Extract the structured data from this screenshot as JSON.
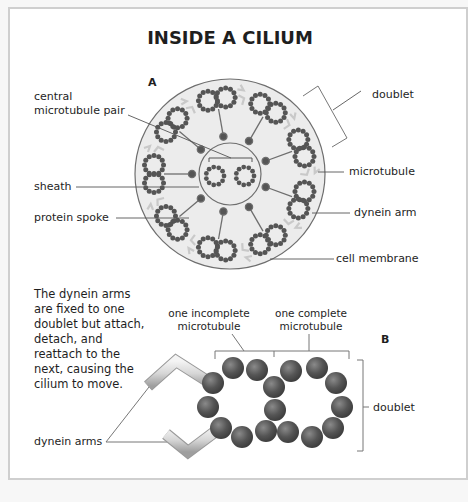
{
  "title": "INSIDE A CILIUM",
  "panel_a": {
    "label": "A",
    "labels": {
      "central_pair_line1": "central",
      "central_pair_line2": "microtubule pair",
      "sheath": "sheath",
      "protein_spoke": "protein spoke",
      "doublet": "doublet",
      "microtubule": "microtubule",
      "dynein_arm": "dynein arm",
      "cell_membrane": "cell membrane"
    }
  },
  "panel_b": {
    "label": "B",
    "caption": [
      "The dynein arms",
      "are fixed to one",
      "doublet but attach,",
      "detach, and",
      "reattach to the",
      "next, causing the",
      "cilium to move."
    ],
    "labels": {
      "incomplete_line1": "one incomplete",
      "incomplete_line2": "microtubule",
      "complete_line1": "one complete",
      "complete_line2": "microtubule",
      "doublet": "doublet",
      "dynein_arms": "dynein arms"
    }
  },
  "colors": {
    "cilium_fill": "#ececec",
    "outline": "#6e6e6e",
    "subunit": "#5a5a5a",
    "text": "#1e1e1e",
    "frame": "#cfcfcf"
  }
}
